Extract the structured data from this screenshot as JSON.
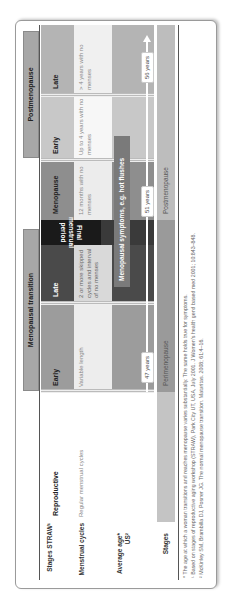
{
  "table": {
    "groups": {
      "menopausal_transition": "Menopausal transition",
      "postmenopause": "Postmenopause"
    },
    "row_labels": {
      "stages_straw": "Stages STRAW¹",
      "menstrual_cycles": "Menstrual cycles",
      "average_age": "Average age* US²",
      "stages": "Stages"
    },
    "stage_headers": {
      "reproductive": "Reproductive",
      "mt_early": "Early",
      "mt_late": "Late",
      "final_menstrual_period": "Final menstrual period",
      "menopause": "Menopause",
      "pm_early": "Early",
      "pm_late": "Late"
    },
    "menstrual_cycles": {
      "reproductive": "Regular menstrual cycles",
      "mt_early": "Variable length",
      "mt_late": "2 or more skipped cycles and interval of no menses",
      "menopause": "12 months with no menses",
      "pm_early": "Up to 4 years with no menses",
      "pm_late": "> 4 years with no menses"
    },
    "symptoms_bar": "Menopausal symptoms, e.g. hot flushes",
    "ages": {
      "perimenopause_start": "47 years",
      "menopause": "51 years",
      "postmenopause": "56 years"
    },
    "stages_row": {
      "perimenopause": "Perimenopause",
      "postmenopause": "Postmenopause"
    },
    "footnotes": [
      "* The age at which a woman transitions and reaches menopause varies substantially. The same holds true for symptoms.",
      "¹ Based on stages of reproductive aging workshop (STRAW), Park City UT, USA, July 2001. J Women's health gend based med 2001; 10:843–848.",
      "² McKinley SM, Brambilla DJ, Posner JG. The normal menopause transition. Maturitas. 2008; 61:4–16."
    ],
    "colors": {
      "reproductive": "#d2d2d2",
      "mt_early": "#9c9c9c",
      "mt_late": "#4a4a4a",
      "fmp": "#1a1a1a",
      "menopause": "#8e8e8e",
      "pm_early": "#c8c8c8",
      "pm_late": "#b4b4b4"
    }
  }
}
